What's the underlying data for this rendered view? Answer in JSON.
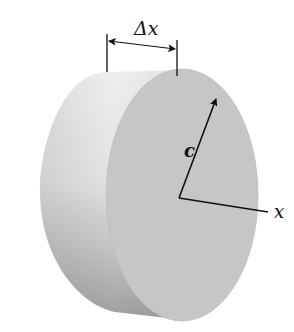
{
  "figure": {
    "labels": {
      "thickness": "Δx",
      "radius": "c",
      "axis": "x"
    },
    "colors": {
      "background": "#ffffff",
      "face": "#c9c9c9",
      "side_light": "#e6e6e6",
      "side_dark": "#a9a9a9",
      "line": "#111111"
    }
  }
}
